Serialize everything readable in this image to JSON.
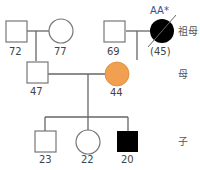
{
  "diagram": {
    "type": "pedigree",
    "colors": {
      "line": "#666666",
      "affected": "#000000",
      "carrier": "#f0a050",
      "unaffected": "#ffffff",
      "annotation": "#3a4f8a"
    },
    "generations": [
      {
        "label": "祖母",
        "row": "grandparents"
      },
      {
        "label": "母",
        "row": "parents"
      },
      {
        "label": "子",
        "row": "children"
      }
    ],
    "individuals": [
      {
        "id": "pgf",
        "sex": "male",
        "age": "72",
        "status": "unaffected"
      },
      {
        "id": "pgm",
        "sex": "female",
        "age": "77",
        "status": "unaffected"
      },
      {
        "id": "mgf",
        "sex": "male",
        "age": "69",
        "status": "unaffected"
      },
      {
        "id": "mgm",
        "sex": "female",
        "age": "(45)",
        "status": "affected-deceased",
        "annotation": "AA*"
      },
      {
        "id": "father",
        "sex": "male",
        "age": "47",
        "status": "unaffected"
      },
      {
        "id": "mother",
        "sex": "female",
        "age": "44",
        "status": "carrier"
      },
      {
        "id": "son1",
        "sex": "male",
        "age": "23",
        "status": "unaffected"
      },
      {
        "id": "daughter",
        "sex": "female",
        "age": "22",
        "status": "unaffected"
      },
      {
        "id": "son2",
        "sex": "male",
        "age": "20",
        "status": "affected"
      }
    ]
  }
}
